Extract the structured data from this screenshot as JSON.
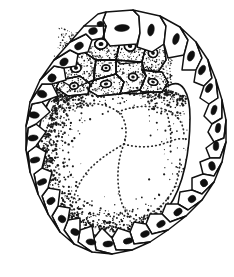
{
  "figure": {
    "caption": "",
    "background_color": "#ffffff",
    "ink_color": "#111111",
    "style": "stippled pen-and-ink line drawing"
  },
  "structures": {
    "outer_layer": {
      "name": "outer epithelial cell layer",
      "cell_count": 26,
      "description": "ring of columnar cells each containing one dark nucleus"
    },
    "inner_cell_mass": {
      "name": "inner cell mass cluster",
      "cell_count": 9,
      "description": "stippled cells with ring-shaped nuclei at the animal pole"
    },
    "yolk_mass": {
      "name": "stippled yolk mass",
      "description": "large central mass, dense stipple at margin fading inward, subdivided by dotted cell boundaries",
      "dotted_cell_count": 6
    }
  },
  "geometry": {
    "outer_ring": [
      {
        "id": "oc-01",
        "pts": "106,12 133,10 139,16 140,33 137,44 110,46 104,38 103,20",
        "nx": 122,
        "ny": 28,
        "rx": 7.5,
        "ry": 3.4,
        "rot": -4,
        "ring": false
      },
      {
        "id": "oc-02",
        "pts": "133,10 160,16 166,26 164,44 152,52 137,47 140,33 139,16",
        "nx": 151,
        "ny": 30,
        "rx": 3.2,
        "ry": 6.0,
        "rot": 10,
        "ring": false
      },
      {
        "id": "oc-03",
        "pts": "160,16 180,27 188,40 184,55 168,58 164,44 166,26",
        "nx": 176,
        "ny": 39,
        "rx": 3.0,
        "ry": 5.8,
        "rot": 18,
        "ring": false
      },
      {
        "id": "oc-04",
        "pts": "180,27 196,42 202,58 196,70 182,70 184,55 188,40",
        "nx": 191,
        "ny": 56,
        "rx": 3.2,
        "ry": 5.4,
        "rot": 24,
        "ring": false
      },
      {
        "id": "oc-05",
        "pts": "196,42 208,60 212,78 204,86 194,82 196,70 202,58",
        "nx": 202,
        "ny": 70,
        "rx": 3.0,
        "ry": 5.2,
        "rot": 30,
        "ring": false
      },
      {
        "id": "oc-06",
        "pts": "208,60 216,80 218,98 209,104 200,98 204,86 212,78",
        "nx": 209,
        "ny": 88,
        "rx": 2.8,
        "ry": 5.0,
        "rot": 32,
        "ring": false
      },
      {
        "id": "oc-07",
        "pts": "216,80 222,100 222,118 212,124 204,116 209,104 218,98",
        "nx": 214,
        "ny": 110,
        "rx": 2.6,
        "ry": 5.0,
        "rot": 18,
        "ring": false
      },
      {
        "id": "oc-08",
        "pts": "222,100 226,120 224,138 214,142 208,132 212,124 222,118",
        "nx": 218,
        "ny": 128,
        "rx": 2.6,
        "ry": 4.8,
        "rot": 10,
        "ring": false
      },
      {
        "id": "oc-09",
        "pts": "226,120 226,142 220,158 210,158 206,148 214,142 224,138",
        "nx": 216,
        "ny": 146,
        "rx": 2.8,
        "ry": 4.6,
        "rot": 4,
        "ring": false
      },
      {
        "id": "oc-10",
        "pts": "226,142 222,162 214,176 203,174 200,162 210,158 220,158",
        "nx": 212,
        "ny": 166,
        "rx": 3.2,
        "ry": 4.4,
        "rot": -14,
        "ring": false
      },
      {
        "id": "oc-11",
        "pts": "222,162 214,182 202,194 192,190 192,178 203,174 214,176",
        "nx": 204,
        "ny": 183,
        "rx": 3.6,
        "ry": 3.8,
        "rot": -28,
        "ring": false
      },
      {
        "id": "oc-12",
        "pts": "214,182 202,200 188,210 178,204 180,192 192,190 202,194",
        "nx": 192,
        "ny": 199,
        "rx": 4.0,
        "ry": 3.4,
        "rot": -36,
        "ring": false
      },
      {
        "id": "oc-13",
        "pts": "202,200 186,216 170,222 162,214 166,204 178,204 188,210",
        "nx": 178,
        "ny": 212,
        "rx": 4.6,
        "ry": 3.2,
        "rot": -38,
        "ring": false
      },
      {
        "id": "oc-14",
        "pts": "186,216 168,230 152,234 146,224 150,214 162,214 170,222",
        "nx": 161,
        "ny": 224,
        "rx": 4.6,
        "ry": 3.0,
        "rot": -30,
        "ring": false
      },
      {
        "id": "oc-15",
        "pts": "168,230 150,242 134,244 130,232 134,222 146,224 152,234",
        "nx": 145,
        "ny": 234,
        "rx": 4.6,
        "ry": 3.0,
        "rot": -22,
        "ring": false
      },
      {
        "id": "oc-16",
        "pts": "150,242 132,250 116,250 112,238 118,228 130,232 134,244",
        "nx": 128,
        "ny": 241,
        "rx": 4.8,
        "ry": 2.9,
        "rot": -14,
        "ring": false
      },
      {
        "id": "oc-17",
        "pts": "132,250 112,254 96,250 94,238 102,228 112,238 116,250",
        "nx": 108,
        "ny": 244,
        "rx": 5.0,
        "ry": 2.9,
        "rot": -6,
        "ring": false
      },
      {
        "id": "oc-18",
        "pts": "112,254 92,252 78,242 80,230 92,226 94,238 96,250",
        "nx": 91,
        "ny": 242,
        "rx": 5.0,
        "ry": 3.0,
        "rot": 8,
        "ring": false
      },
      {
        "id": "oc-19",
        "pts": "92,252 74,244 64,230 68,220 80,218 80,230 78,242",
        "nx": 75,
        "ny": 232,
        "rx": 4.4,
        "ry": 3.2,
        "rot": 24,
        "ring": false
      },
      {
        "id": "oc-20",
        "pts": "74,244 60,232 52,216 58,206 70,208 68,220 64,230",
        "nx": 62,
        "ny": 219,
        "rx": 4.0,
        "ry": 3.4,
        "rot": 38,
        "ring": false
      },
      {
        "id": "oc-21",
        "pts": "60,232 48,214 42,196 48,188 60,190 58,206 52,216",
        "nx": 51,
        "ny": 201,
        "rx": 3.2,
        "ry": 4.4,
        "rot": 56,
        "ring": false
      },
      {
        "id": "oc-22",
        "pts": "48,214 38,194 34,174 42,168 52,172 48,188 42,196",
        "nx": 42,
        "ny": 182,
        "rx": 2.8,
        "ry": 5.0,
        "rot": 68,
        "ring": false
      },
      {
        "id": "oc-23",
        "pts": "38,194 30,172 28,152 36,146 46,152 42,168 34,174",
        "nx": 35,
        "ny": 160,
        "rx": 2.8,
        "ry": 5.0,
        "rot": 76,
        "ring": false
      },
      {
        "id": "oc-24",
        "pts": "30,172 26,150 28,128 36,124 46,132 36,146 28,152",
        "nx": 33,
        "ny": 138,
        "rx": 3.0,
        "ry": 5.2,
        "rot": 84,
        "ring": false
      },
      {
        "id": "oc-25",
        "pts": "26,150 26,126 32,104 42,102 50,112 36,124 28,128",
        "nx": 34,
        "ny": 115,
        "rx": 3.2,
        "ry": 5.4,
        "rot": 96,
        "ring": false
      },
      {
        "id": "oc-26",
        "pts": "26,126 30,102 42,84 52,84 58,96 42,102 32,104",
        "nx": 42,
        "ny": 94,
        "rx": 3.6,
        "ry": 5.0,
        "rot": 110,
        "ring": false
      },
      {
        "id": "oc-27",
        "pts": "30,102 40,80 54,66 64,68 66,80 52,84 42,84",
        "nx": 52,
        "ny": 78,
        "rx": 4.2,
        "ry": 4.0,
        "rot": 126,
        "ring": false
      },
      {
        "id": "oc-28",
        "pts": "40,80 54,60 70,50 78,54 76,66 64,68 54,66",
        "nx": 64,
        "ny": 62,
        "rx": 4.6,
        "ry": 3.6,
        "rot": 140,
        "ring": false
      },
      {
        "id": "oc-29",
        "pts": "54,60 70,42 86,34 92,40 88,52 78,54 70,50",
        "nx": 79,
        "ny": 46,
        "rx": 4.6,
        "ry": 3.4,
        "rot": 152,
        "ring": false
      },
      {
        "id": "oc-30",
        "pts": "70,42 84,26 102,18 106,26 103,38 92,40 86,34",
        "nx": 93,
        "ny": 31,
        "rx": 4.4,
        "ry": 3.4,
        "rot": 164,
        "ring": false
      },
      {
        "id": "oc-31",
        "pts": "84,26 98,14 106,12 103,20 104,38 103,38 106,26",
        "nx": 100,
        "ny": 24,
        "rx": 3.0,
        "ry": 2.6,
        "rot": 170,
        "ring": false
      }
    ],
    "icm_cells": [
      {
        "id": "icm-01",
        "pts": "62,62 84,52 96,60 94,80 74,88 60,80",
        "nx": 76,
        "ny": 68,
        "rx": 5.0,
        "ry": 4.2,
        "rot": -12,
        "ring": true
      },
      {
        "id": "icm-02",
        "pts": "84,30 112,28 120,42 116,60 96,60 84,52",
        "nx": 101,
        "ny": 44,
        "rx": 6.2,
        "ry": 5.0,
        "rot": -6,
        "ring": true
      },
      {
        "id": "icm-03",
        "pts": "112,28 140,32 146,46 142,62 120,64 116,60 120,42",
        "nx": 130,
        "ny": 46,
        "rx": 5.6,
        "ry": 5.0,
        "rot": 4,
        "ring": true
      },
      {
        "id": "icm-04",
        "pts": "140,32 164,44 166,60 158,72 142,70 142,62 146,46",
        "nx": 153,
        "ny": 53,
        "rx": 4.6,
        "ry": 4.4,
        "rot": 14,
        "ring": true
      },
      {
        "id": "icm-05",
        "pts": "94,80 116,74 124,82 120,94 98,96 88,90",
        "nx": 106,
        "ny": 84,
        "rx": 5.4,
        "ry": 3.4,
        "rot": -4,
        "ring": true
      },
      {
        "id": "icm-06",
        "pts": "116,60 142,62 146,76 140,90 120,94 124,82 116,74",
        "nx": 133,
        "ny": 77,
        "rx": 4.4,
        "ry": 3.6,
        "rot": 6,
        "ring": true
      },
      {
        "id": "icm-07",
        "pts": "142,70 162,72 168,82 162,92 142,92 140,90 146,76",
        "nx": 153,
        "ny": 82,
        "rx": 4.8,
        "ry": 3.2,
        "rot": 12,
        "ring": true
      },
      {
        "id": "icm-08",
        "pts": "60,80 80,76 90,84 88,94 68,96 56,88",
        "nx": 74,
        "ny": 86,
        "rx": 4.2,
        "ry": 3.2,
        "rot": -10,
        "ring": true
      },
      {
        "id": "icm-09",
        "pts": "96,60 116,60 116,74 94,80 94,70",
        "nx": 106,
        "ny": 68,
        "rx": 3.8,
        "ry": 3.0,
        "rot": 0,
        "ring": true
      }
    ],
    "yolk_outline": "M 56,92 C 60,82 78,80 100,88 C 124,96 150,96 168,86 C 182,78 190,92 190,118 C 190,150 184,186 168,208 C 152,228 122,240 98,236 C 74,232 54,212 44,180 C 34,148 36,114 56,92 Z",
    "inner_dotted_boundaries": [
      "M 78,104 C 92,102 108,104 118,112 C 126,118 128,132 124,144",
      "M 118,112 C 132,106 150,104 166,110 C 178,114 184,124 184,136",
      "M 124,144 C 136,148 154,148 168,142 C 178,138 184,138 186,140",
      "M 124,144 C 118,158 116,178 120,196 C 122,208 128,216 136,220",
      "M 124,144 C 110,152 94,162 84,176 C 76,188 72,200 72,210",
      "M 136,220 C 150,216 164,206 172,192 C 178,182 180,170 180,158",
      "M 166,110 C 170,122 172,136 170,148"
    ],
    "stipple_band": {
      "description": "dense stipple along upper/left/lower margin of yolk mass fading toward center",
      "dot_count": 1500
    }
  }
}
